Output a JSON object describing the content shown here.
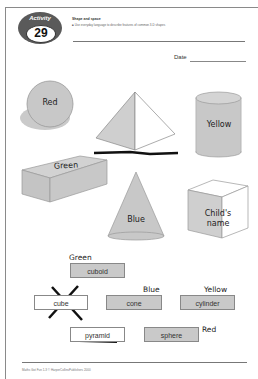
{
  "activity": {
    "label": "Activity",
    "number": "29"
  },
  "header": {
    "title": "Shape and space",
    "instruction": "Use everyday language to describe features of common 3-D shapes"
  },
  "date": {
    "label": "Date"
  },
  "shapes": [
    {
      "id": "sphere",
      "label": "Red"
    },
    {
      "id": "pyramid",
      "label": ""
    },
    {
      "id": "cylinder",
      "label": "Yellow"
    },
    {
      "id": "cuboid",
      "label": "Green"
    },
    {
      "id": "cone",
      "label": "Blue"
    },
    {
      "id": "cube",
      "label": "Child's name",
      "line1": "Child's",
      "line2": "name"
    }
  ],
  "labels": [
    {
      "text": "cuboid",
      "annotation": "Green",
      "state": "filled"
    },
    {
      "text": "cube",
      "annotation": "",
      "state": "crossed-out"
    },
    {
      "text": "cone",
      "annotation": "Blue",
      "state": "filled"
    },
    {
      "text": "cylinder",
      "annotation": "Yellow",
      "state": "filled"
    },
    {
      "text": "pyramid",
      "annotation": "",
      "state": "underlined"
    },
    {
      "text": "sphere",
      "annotation": "Red",
      "state": "filled"
    }
  ],
  "footer": {
    "text": "Maths Got Fun 1-3 © HarperCollinsPublishers 2000"
  },
  "colors": {
    "shape_fill": "#c8c8c8",
    "shape_stroke": "#888888",
    "ink": "#111111"
  }
}
